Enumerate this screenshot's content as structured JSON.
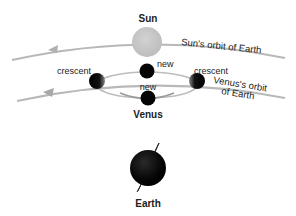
{
  "labels": {
    "sun": "Sun",
    "sun_orbit": "Sun's orbit of Earth",
    "new_top": "new",
    "new_bottom": "new",
    "crescent_left": "crescent",
    "crescent_right": "crescent",
    "venus_orbit_line1": "Venus's orbit",
    "venus_orbit_line2": "of Earth",
    "venus": "Venus",
    "earth": "Earth"
  },
  "colors": {
    "orbit": "#b8b8b8",
    "sun": "#c4c4c4",
    "planet": "#0a0a0a",
    "text": "#222222"
  }
}
